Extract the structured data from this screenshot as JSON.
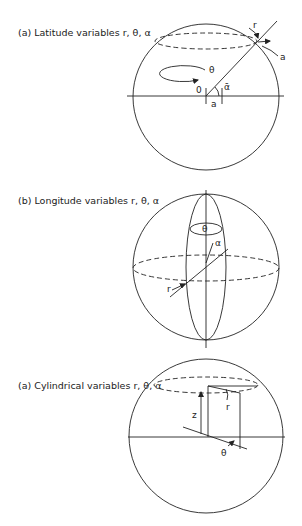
{
  "figures": [
    {
      "caption": "(a) Latitude variables r, θ, α",
      "labels": {
        "r": "r",
        "a_outer": "a",
        "theta": "θ",
        "origin": "0",
        "alpha": "ᾱ",
        "a_base": "a"
      }
    },
    {
      "caption": "(b) Longitude variables r, θ, α",
      "labels": {
        "theta": "θ",
        "alpha": "α",
        "r": "r"
      }
    },
    {
      "caption": "(a) Cylindrical variables r, θ, α",
      "labels": {
        "z": "z",
        "r": "r",
        "theta": "θ"
      }
    }
  ],
  "colors": {
    "ink": "#222222",
    "background": "#ffffff"
  }
}
